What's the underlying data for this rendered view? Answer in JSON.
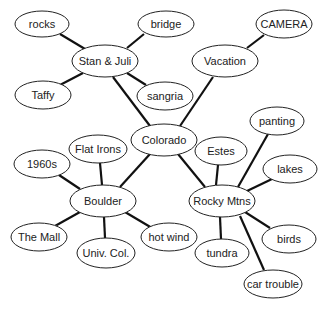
{
  "diagram": {
    "type": "mind-map",
    "nodes": [
      {
        "id": "colorado",
        "label": "Colorado",
        "cx": 164,
        "cy": 140,
        "rx": 33,
        "ry": 16
      },
      {
        "id": "stan",
        "label": "Stan & Juli",
        "cx": 105,
        "cy": 61,
        "rx": 33,
        "ry": 16
      },
      {
        "id": "vacation",
        "label": "Vacation",
        "cx": 225,
        "cy": 61,
        "rx": 33,
        "ry": 16
      },
      {
        "id": "boulder",
        "label": "Boulder",
        "cx": 103,
        "cy": 201,
        "rx": 33,
        "ry": 16
      },
      {
        "id": "rocky",
        "label": "Rocky Mtns",
        "cx": 222,
        "cy": 201,
        "rx": 33,
        "ry": 16
      },
      {
        "id": "rocks",
        "label": "rocks",
        "cx": 42,
        "cy": 24,
        "rx": 27,
        "ry": 13
      },
      {
        "id": "bridge",
        "label": "bridge",
        "cx": 166,
        "cy": 24,
        "rx": 28,
        "ry": 13
      },
      {
        "id": "taffy",
        "label": "Taffy",
        "cx": 43,
        "cy": 95,
        "rx": 28,
        "ry": 14
      },
      {
        "id": "sangria",
        "label": "sangria",
        "cx": 165,
        "cy": 96,
        "rx": 28,
        "ry": 14
      },
      {
        "id": "camera",
        "label": "CAMERA",
        "cx": 284,
        "cy": 24,
        "rx": 28,
        "ry": 14
      },
      {
        "id": "flatirons",
        "label": "Flat Irons",
        "cx": 98,
        "cy": 149,
        "rx": 29,
        "ry": 14
      },
      {
        "id": "1960s",
        "label": "1960s",
        "cx": 42,
        "cy": 164,
        "rx": 28,
        "ry": 14
      },
      {
        "id": "mall",
        "label": "The Mall",
        "cx": 39,
        "cy": 237,
        "rx": 28,
        "ry": 14
      },
      {
        "id": "univ",
        "label": "Univ. Col.",
        "cx": 106,
        "cy": 253,
        "rx": 29,
        "ry": 15
      },
      {
        "id": "hotwind",
        "label": "hot wind",
        "cx": 169,
        "cy": 237,
        "rx": 28,
        "ry": 14
      },
      {
        "id": "panting",
        "label": "panting",
        "cx": 277,
        "cy": 121,
        "rx": 27,
        "ry": 14
      },
      {
        "id": "estes",
        "label": "Estes",
        "cx": 221,
        "cy": 151,
        "rx": 26,
        "ry": 14
      },
      {
        "id": "lakes",
        "label": "lakes",
        "cx": 290,
        "cy": 169,
        "rx": 27,
        "ry": 14
      },
      {
        "id": "birds",
        "label": "birds",
        "cx": 289,
        "cy": 239,
        "rx": 27,
        "ry": 14
      },
      {
        "id": "tundra",
        "label": "tundra",
        "cx": 222,
        "cy": 253,
        "rx": 27,
        "ry": 14
      },
      {
        "id": "cartrouble",
        "label": "car trouble",
        "cx": 273,
        "cy": 284,
        "rx": 29,
        "ry": 14
      }
    ],
    "edges": [
      {
        "x1": 60,
        "y1": 34,
        "x2": 85,
        "y2": 49
      },
      {
        "x1": 144,
        "y1": 34,
        "x2": 127,
        "y2": 48
      },
      {
        "x1": 60,
        "y1": 85,
        "x2": 83,
        "y2": 73
      },
      {
        "x1": 127,
        "y1": 73,
        "x2": 146,
        "y2": 85
      },
      {
        "x1": 113,
        "y1": 77,
        "x2": 150,
        "y2": 126
      },
      {
        "x1": 264,
        "y1": 35,
        "x2": 247,
        "y2": 48
      },
      {
        "x1": 213,
        "y1": 77,
        "x2": 180,
        "y2": 126
      },
      {
        "x1": 150,
        "y1": 154,
        "x2": 120,
        "y2": 187
      },
      {
        "x1": 178,
        "y1": 154,
        "x2": 205,
        "y2": 187
      },
      {
        "x1": 100,
        "y1": 163,
        "x2": 102,
        "y2": 185
      },
      {
        "x1": 59,
        "y1": 175,
        "x2": 80,
        "y2": 189
      },
      {
        "x1": 55,
        "y1": 226,
        "x2": 80,
        "y2": 212
      },
      {
        "x1": 104,
        "y1": 217,
        "x2": 105,
        "y2": 238
      },
      {
        "x1": 125,
        "y1": 212,
        "x2": 152,
        "y2": 228
      },
      {
        "x1": 218,
        "y1": 165,
        "x2": 216,
        "y2": 185
      },
      {
        "x1": 268,
        "y1": 134,
        "x2": 238,
        "y2": 187
      },
      {
        "x1": 272,
        "y1": 179,
        "x2": 247,
        "y2": 191
      },
      {
        "x1": 245,
        "y1": 212,
        "x2": 270,
        "y2": 228
      },
      {
        "x1": 220,
        "y1": 217,
        "x2": 221,
        "y2": 239
      },
      {
        "x1": 240,
        "y1": 216,
        "x2": 264,
        "y2": 270
      }
    ]
  }
}
